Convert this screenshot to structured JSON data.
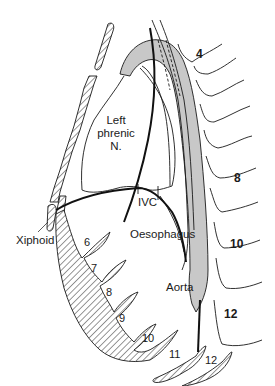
{
  "figure": {
    "type": "anatomical-diagram",
    "view": "left lateral (sagittal) section of thorax and upper abdomen",
    "colors": {
      "line": "#1a1a1a",
      "aorta_fill": "#c8c8c8",
      "background": "#ffffff"
    }
  },
  "labels": {
    "left_phrenic_line1": "Left",
    "left_phrenic_line2": "phrenic",
    "left_phrenic_line3": "N.",
    "ivc": "IVC",
    "oesophagus": "Oesophagus",
    "xiphoid": "Xiphoid",
    "aorta": "Aorta"
  },
  "vertebrae": {
    "v4": "4",
    "v8": "8",
    "v10": "10",
    "v12": "12"
  },
  "costal_cartilages": {
    "c6": "6",
    "c7": "7",
    "c8": "8",
    "c9": "9",
    "c10": "10",
    "c11": "11",
    "c12": "12"
  }
}
